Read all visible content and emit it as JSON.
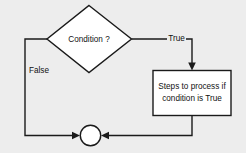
{
  "diagram": {
    "background_color": "#ededed",
    "line_color": "#1a1a1a",
    "shape_fill_color": "#ffffff",
    "nodes": [
      {
        "id": "decision",
        "shape": "diamond",
        "label": "Condition ?"
      },
      {
        "id": "process",
        "shape": "rectangle",
        "label_line1": "Steps to process if",
        "label_line2": "condition is True"
      },
      {
        "id": "merge",
        "shape": "circle",
        "label": ""
      }
    ],
    "edges": [
      {
        "id": "true-branch",
        "from": "decision",
        "to": "process",
        "label": "True"
      },
      {
        "id": "false-branch",
        "from": "decision",
        "to": "merge",
        "label": "False"
      },
      {
        "id": "process-to-merge",
        "from": "process",
        "to": "merge",
        "label": ""
      }
    ]
  }
}
